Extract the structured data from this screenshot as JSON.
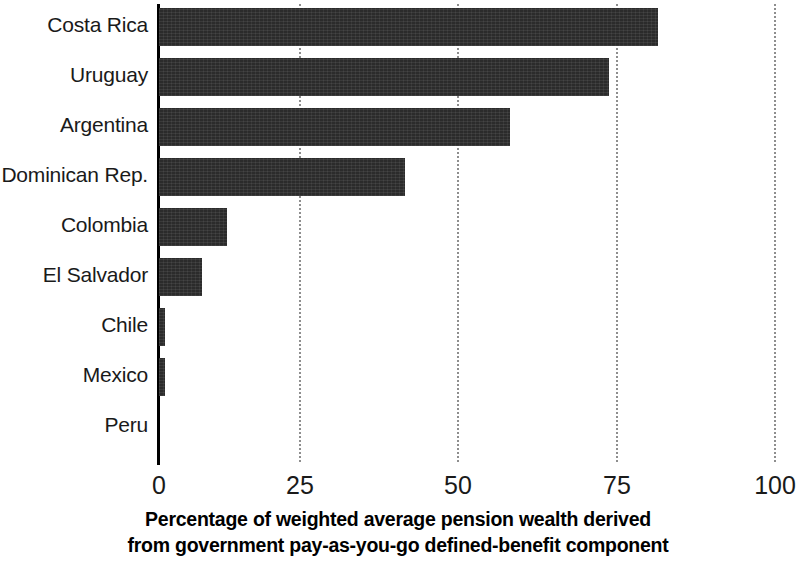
{
  "chart_data": {
    "type": "bar",
    "orientation": "horizontal",
    "title": "",
    "subtitle": "",
    "xlabel": "Percentage of weighted average pension wealth derived from government pay-as-you-go defined-benefit component",
    "xlabel_lines": [
      "Percentage of weighted average pension wealth derived",
      "from government pay-as-you-go defined-benefit component"
    ],
    "ylabel": "",
    "categories": [
      "Costa Rica",
      "Uruguay",
      "Argentina",
      "Dominican Rep.",
      "Colombia",
      "El Salvador",
      "Chile",
      "Mexico",
      "Peru"
    ],
    "values": [
      81,
      73,
      57,
      40,
      11,
      7,
      1,
      1,
      0
    ],
    "xlim": [
      0,
      100
    ],
    "ylim": null,
    "xticks": [
      0,
      25,
      50,
      75,
      100
    ],
    "xtick_labels": [
      "0",
      "25",
      "50",
      "75",
      "100"
    ],
    "grid": true,
    "grid_axis": "x",
    "grid_style": "dotted",
    "legend": null,
    "legend_position": "none",
    "bar_color": "#2b2b2b",
    "grid_color": "#8e8e8e",
    "axis_color": "#000000",
    "background_color": "#ffffff"
  }
}
